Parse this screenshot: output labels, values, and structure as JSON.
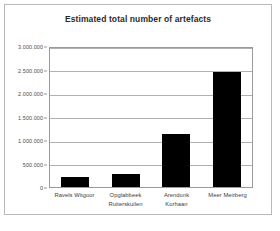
{
  "figure": {
    "title": "Estimated total number of artefacts",
    "border_color": "#b9b9b9",
    "background": "#ffffff"
  },
  "axis": {
    "y_tick_labels": [
      "3.000.000",
      "2.500.000",
      "2.000.000",
      "1.500.000",
      "1.000.000",
      "500.000",
      "0"
    ],
    "x_tick_labels": [
      {
        "line1": "Ravels Witgoor",
        "line2": ""
      },
      {
        "line1": "Opglabbeek",
        "line2": "Ruiterskuilen"
      },
      {
        "line1": "Arendonk",
        "line2": "Korhaan"
      },
      {
        "line1": "Meer Meirberg",
        "line2": ""
      }
    ]
  },
  "chart_data": {
    "type": "bar",
    "title": "Estimated total number of artefacts",
    "xlabel": "",
    "ylabel": "",
    "categories": [
      "Ravels Witgoor",
      "Opglabbeek Ruiterskuilen",
      "Arendonk Korhaan",
      "Meer Meirberg"
    ],
    "values": [
      210000,
      270000,
      1130000,
      2440000
    ],
    "ylim": [
      0,
      3000000
    ],
    "ytick_step": 500000,
    "yticks": [
      0,
      500000,
      1000000,
      1500000,
      2000000,
      2500000,
      3000000
    ],
    "grid": "horizontal",
    "legend": "none",
    "bar_color": "#000000",
    "gridline_color": "#b0b0b0",
    "plot_frame_color": "#9a9a9a"
  }
}
